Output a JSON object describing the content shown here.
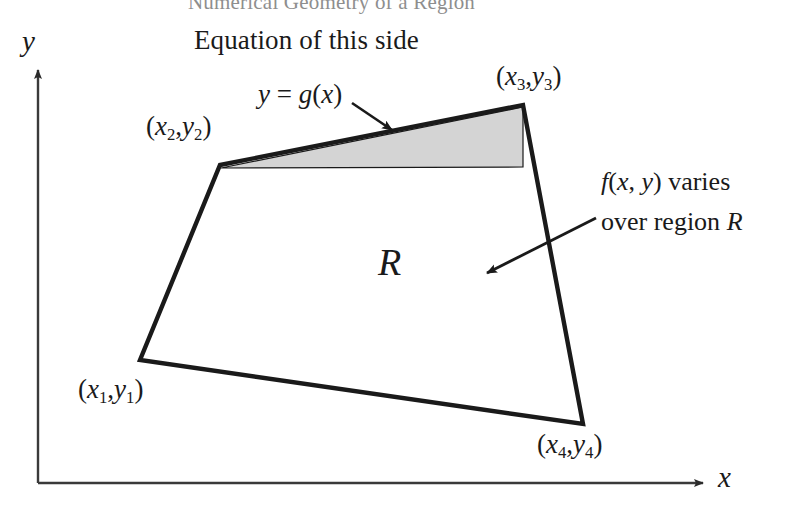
{
  "figure": {
    "top_cut_title": "Numerical Geometry of a Region",
    "axes": {
      "y_label": "y",
      "x_label": "x"
    },
    "captions": {
      "equation_of_side": "Equation of this side",
      "function_g": {
        "y": "y",
        "equals": " = ",
        "g": "g",
        "open": "(",
        "x": "x",
        "close": ")"
      },
      "f_varies_line1": {
        "f": "f",
        "open": "(",
        "x": "x",
        "comma": ", ",
        "y": "y",
        "close": ")",
        "tail": " varies"
      },
      "f_varies_line2": {
        "head": "over region ",
        "r": "R"
      }
    },
    "region_label": "R",
    "vertices": [
      {
        "name": "vertex-1",
        "label_x": "x",
        "label_sub": "1",
        "label_y": "y",
        "px": 140,
        "py": 360
      },
      {
        "name": "vertex-2",
        "label_x": "x",
        "label_sub": "2",
        "label_y": "y",
        "px": 220,
        "py": 165
      },
      {
        "name": "vertex-3",
        "label_x": "x",
        "label_sub": "3",
        "label_y": "y",
        "px": 523,
        "py": 105
      },
      {
        "name": "vertex-4",
        "label_x": "x",
        "label_sub": "4",
        "label_y": "y",
        "px": 583,
        "py": 424
      }
    ],
    "colors": {
      "stroke": "#1a1a1a",
      "shaded_strip_fill": "#d4d4d4",
      "axis_stroke": "#3a3a3a",
      "background": "#ffffff"
    },
    "geometry": {
      "quad_points": "140,360 220,165 523,105 583,424",
      "shaded_strip_points": "220,168 523,106 523,166 222,168",
      "axis_origin": {
        "x": 38,
        "y": 483
      },
      "y_axis_top": 62,
      "x_axis_right": 712
    }
  }
}
